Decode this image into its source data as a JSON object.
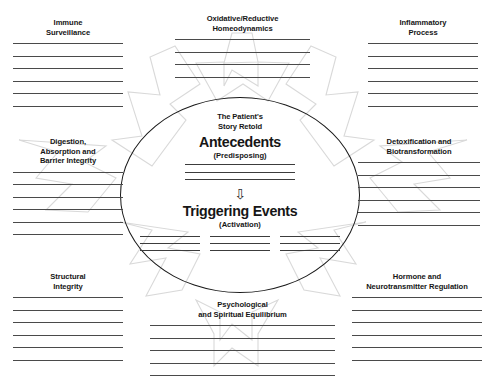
{
  "diagram": {
    "top_clipped_text": "",
    "center": {
      "eyebrow_line1": "The Patient's",
      "eyebrow_line2": "Story Retold",
      "heading_1": "Antecedents",
      "subheading_1": "(Predisposing)",
      "antecedent_rule_count": 3,
      "arrow_icon": "down-arrow-icon",
      "arrow_glyph": "⇩",
      "heading_2": "Triggering Events",
      "subheading_2": "(Activation)",
      "trigger_columns": 3,
      "trigger_rules_per_column": 3
    },
    "nodes": [
      {
        "id": "immune-surveillance",
        "title": "Immune\nSurveillance",
        "rule_count": 6
      },
      {
        "id": "oxidative-reductive-homeodynamics",
        "title": "Oxidative/Reductive\nHomeodynamics",
        "rule_count": 4
      },
      {
        "id": "inflammatory-process",
        "title": "Inflammatory\nProcess",
        "rule_count": 6
      },
      {
        "id": "digestion-absorption-barrier-integrity",
        "title": "Digestion,\nAbsorption and\nBarrier Integrity",
        "rule_count": 6
      },
      {
        "id": "detoxification-and-biotransformation",
        "title": "Detoxification and\nBiotransformation",
        "rule_count": 6
      },
      {
        "id": "structural-integrity",
        "title": "Structural\nIntegrity",
        "rule_count": 6
      },
      {
        "id": "psychological-and-spiritual-equilibrium",
        "title": "Psychological\nand Spiritual Equilibrium",
        "rule_count": 5
      },
      {
        "id": "hormone-and-neurotransmitter-regulation",
        "title": "Hormone and\nNeurotransmitter Regulation",
        "rule_count": 6
      }
    ],
    "colors": {
      "background": "#ffffff",
      "text": "#161616",
      "oval_stroke": "#1a1a1a",
      "rule_stroke": "#4a4a4a",
      "star_stroke": "#d9d9d9"
    }
  }
}
